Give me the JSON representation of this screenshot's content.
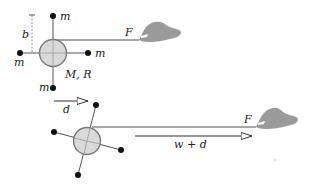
{
  "colors": {
    "disk_fill": "#d9d9d9",
    "disk_stroke": "#7a7a7a",
    "string": "#8a8a8a",
    "rod": "#555555",
    "mass": "#111111",
    "hand": "#9a9a9a",
    "arrow": "#333333"
  },
  "top_figure": {
    "mass_labels": [
      "m",
      "m",
      "m",
      "m"
    ],
    "distance_label": "b",
    "disk_label": "M, R",
    "force_label": "F"
  },
  "displacement_arrow": {
    "label": "d"
  },
  "bottom_figure": {
    "force_label": "F",
    "pull_arrow_label": "w + d"
  }
}
